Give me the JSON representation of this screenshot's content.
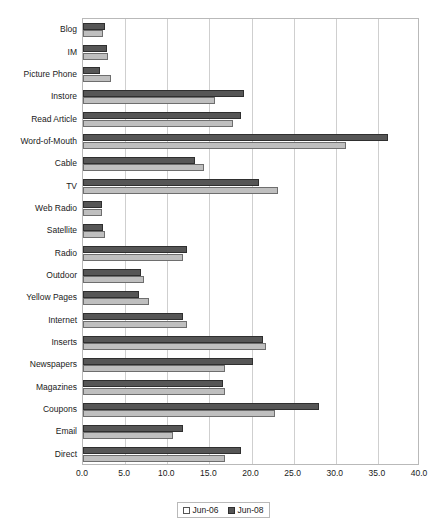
{
  "chart_data": {
    "type": "bar",
    "orientation": "horizontal",
    "title": "",
    "subtitle": "",
    "xlabel": "",
    "ylabel": "",
    "xlim": [
      0.0,
      40.0
    ],
    "xticks": [
      "0.0",
      "5.0",
      "10.0",
      "15.0",
      "20.0",
      "25.0",
      "30.0",
      "35.0",
      "40.0"
    ],
    "xtick_values": [
      0,
      5,
      10,
      15,
      20,
      25,
      30,
      35,
      40
    ],
    "grid": "vertical",
    "legend_position": "bottom-center",
    "categories": [
      "Blog",
      "IM",
      "Picture Phone",
      "Instore",
      "Read Article",
      "Word-of-Mouth",
      "Cable",
      "TV",
      "Web Radio",
      "Satellite",
      "Radio",
      "Outdoor",
      "Yellow Pages",
      "Internet",
      "Inserts",
      "Newspapers",
      "Magazines",
      "Coupons",
      "Email",
      "Direct"
    ],
    "series": [
      {
        "name": "Jun-08",
        "color": "#565656",
        "values": [
          2.6,
          2.8,
          2.0,
          19.1,
          18.8,
          36.2,
          13.3,
          20.9,
          2.3,
          2.4,
          12.3,
          6.9,
          6.6,
          11.9,
          21.4,
          20.2,
          16.6,
          28.0,
          11.9,
          18.7
        ]
      },
      {
        "name": "Jun-06",
        "color": "#bfbfbf",
        "values": [
          2.4,
          3.0,
          3.3,
          15.7,
          17.8,
          31.2,
          14.4,
          23.2,
          2.2,
          2.6,
          11.9,
          7.2,
          7.8,
          12.3,
          21.7,
          16.9,
          16.9,
          22.8,
          10.7,
          16.9
        ]
      }
    ]
  },
  "legend": {
    "items": [
      {
        "label": "Jun-06",
        "swatch": "s1"
      },
      {
        "label": "Jun-08",
        "swatch": "s0"
      }
    ]
  }
}
